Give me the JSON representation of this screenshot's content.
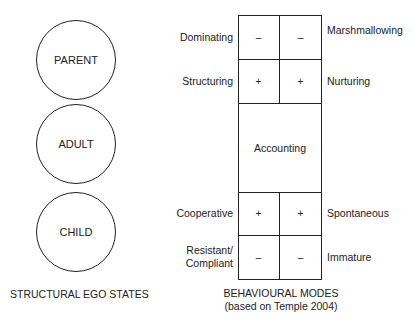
{
  "structural": {
    "circles": [
      "PARENT",
      "ADULT",
      "CHILD"
    ],
    "caption": "STRUCTURAL EGO STATES"
  },
  "behavioural": {
    "top_left_labels": [
      "Dominating",
      "Structuring"
    ],
    "top_right_labels": [
      "Marshmallowing",
      "Nurturing"
    ],
    "top_cells": [
      [
        "–",
        "–"
      ],
      [
        "+",
        "+"
      ]
    ],
    "middle": "Accounting",
    "bottom_left_labels": [
      "Cooperative",
      "Resistant/\nCompliant"
    ],
    "bottom_left_label_lines": [
      "Resistant/",
      "Compliant"
    ],
    "bottom_right_labels": [
      "Spontaneous",
      "Immature"
    ],
    "bottom_cells": [
      [
        "+",
        "+"
      ],
      [
        "–",
        "–"
      ]
    ],
    "caption_line1": "BEHAVIOURAL MODES",
    "caption_line2": "(based on Temple 2004)"
  }
}
